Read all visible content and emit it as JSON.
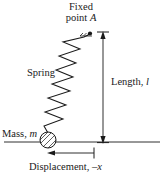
{
  "diagram": {
    "background_color": "#ffffff",
    "ink_color": "#1a1a1a",
    "labels": {
      "fixed_point_line1": "Fixed",
      "fixed_point_line2": "point ",
      "fixed_point_symbol": "A",
      "spring": "Spring",
      "length_text": "Length, ",
      "length_symbol": "l",
      "mass_text": "Mass, ",
      "mass_symbol": "m",
      "displacement_text": "Displacement, ",
      "displacement_symbol": "–x"
    },
    "icons": {
      "anchor": "fixed-point-dot",
      "spring": "zigzag-spring",
      "mass": "hatched-circle-mass",
      "length_dim": "double-headed-vertical-arrow",
      "displacement_dim": "left-pointing-arrow",
      "baseline": "horizontal-reference-line"
    },
    "geometry": {
      "anchor_point": {
        "x": 90,
        "y": 33
      },
      "mass_center": {
        "x": 48,
        "y": 140
      },
      "mass_radius": 8,
      "baseline_y": 142,
      "baseline_x1": 4,
      "baseline_x2": 160,
      "length_arrow_x": 103,
      "length_arrow_top_y": 33,
      "length_arrow_bottom_y": 142,
      "displacement_arrow_y": 153,
      "displacement_arrow_left_x": 48,
      "displacement_arrow_right_x": 94,
      "spring_coils": 10
    }
  }
}
